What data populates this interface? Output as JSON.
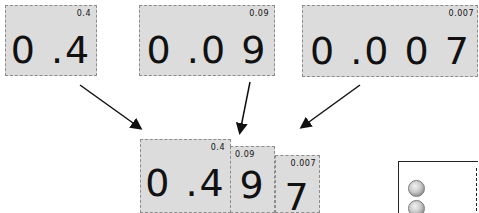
{
  "top_cards": [
    {
      "tag": "0.4",
      "number": "0 .4"
    },
    {
      "tag": "0.09",
      "number": "0 .0 9"
    },
    {
      "tag": "0.007",
      "number": "0 .0 0 7"
    }
  ],
  "combined_cards": [
    {
      "tag": "0.4",
      "number": "0 .4"
    },
    {
      "tag": "0.09",
      "number": "9"
    },
    {
      "tag": "0.007",
      "number": "7"
    }
  ],
  "arrows": [
    {
      "from": "card-0.4",
      "to": "combined-0.4"
    },
    {
      "from": "card-0.09",
      "to": "combined-0.09"
    },
    {
      "from": "card-0.007",
      "to": "combined-0.007"
    }
  ],
  "coin_box": {
    "coins_visible": 2,
    "coin_type": "dime"
  },
  "colors": {
    "card_fill": "#dcdcdc",
    "card_border": "#8c8c8c",
    "text": "#111111"
  }
}
